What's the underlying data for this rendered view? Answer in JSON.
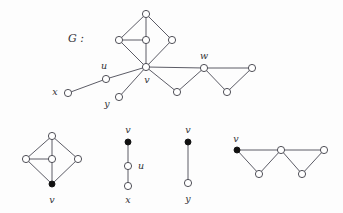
{
  "figure": {
    "caption_label": "G :",
    "background_color": "#fdfdfd",
    "stroke_color": "#4a4a55",
    "node_fill_open": "#ffffff",
    "node_fill_closed": "#111111",
    "label_color": "#333338"
  },
  "chart_data": {
    "type": "diagram",
    "title": "G :",
    "panels": [
      {
        "name": "main-graph",
        "label": "G :",
        "label_x": 76,
        "label_y": 39,
        "nodes": [
          {
            "id": "a",
            "x": 146,
            "y": 14,
            "filled": false,
            "label": ""
          },
          {
            "id": "b",
            "x": 119,
            "y": 40,
            "filled": false,
            "label": ""
          },
          {
            "id": "c",
            "x": 146,
            "y": 40,
            "filled": false,
            "label": ""
          },
          {
            "id": "d",
            "x": 172,
            "y": 40,
            "filled": false,
            "label": ""
          },
          {
            "id": "v",
            "x": 146,
            "y": 67,
            "filled": false,
            "label": "v",
            "label_x": 147,
            "label_y": 80
          },
          {
            "id": "u",
            "x": 106,
            "y": 79,
            "filled": false,
            "label": "u",
            "label_x": 104,
            "label_y": 66
          },
          {
            "id": "x",
            "x": 68,
            "y": 93,
            "filled": false,
            "label": "x",
            "label_x": 55,
            "label_y": 92
          },
          {
            "id": "y",
            "x": 119,
            "y": 97,
            "filled": false,
            "label": "y",
            "label_x": 107,
            "label_y": 104
          },
          {
            "id": "p",
            "x": 177,
            "y": 92,
            "filled": false,
            "label": ""
          },
          {
            "id": "w",
            "x": 204,
            "y": 68,
            "filled": false,
            "label": "w",
            "label_x": 204,
            "label_y": 56
          },
          {
            "id": "q",
            "x": 227,
            "y": 92,
            "filled": false,
            "label": ""
          },
          {
            "id": "r",
            "x": 252,
            "y": 68,
            "filled": false,
            "label": ""
          }
        ],
        "edges": [
          [
            "a",
            "b"
          ],
          [
            "a",
            "c"
          ],
          [
            "a",
            "d"
          ],
          [
            "b",
            "c"
          ],
          [
            "b",
            "v"
          ],
          [
            "c",
            "v"
          ],
          [
            "d",
            "v"
          ],
          [
            "v",
            "u"
          ],
          [
            "u",
            "x"
          ],
          [
            "v",
            "y"
          ],
          [
            "v",
            "p"
          ],
          [
            "p",
            "w"
          ],
          [
            "v",
            "w"
          ],
          [
            "w",
            "q"
          ],
          [
            "q",
            "r"
          ],
          [
            "w",
            "r"
          ]
        ]
      },
      {
        "name": "component-diamond",
        "nodes": [
          {
            "id": "t",
            "x": 52,
            "y": 136,
            "filled": false,
            "label": ""
          },
          {
            "id": "l",
            "x": 26,
            "y": 159,
            "filled": false,
            "label": ""
          },
          {
            "id": "m",
            "x": 52,
            "y": 159,
            "filled": false,
            "label": ""
          },
          {
            "id": "rr",
            "x": 78,
            "y": 159,
            "filled": false,
            "label": ""
          },
          {
            "id": "v",
            "x": 52,
            "y": 184,
            "filled": true,
            "label": "v",
            "label_x": 52,
            "label_y": 200
          }
        ],
        "edges": [
          [
            "t",
            "l"
          ],
          [
            "t",
            "m"
          ],
          [
            "t",
            "rr"
          ],
          [
            "l",
            "m"
          ],
          [
            "l",
            "v"
          ],
          [
            "m",
            "v"
          ],
          [
            "rr",
            "v"
          ]
        ]
      },
      {
        "name": "component-path-vux",
        "nodes": [
          {
            "id": "v",
            "x": 128,
            "y": 142,
            "filled": true,
            "label": "v",
            "label_x": 128,
            "label_y": 130
          },
          {
            "id": "u",
            "x": 128,
            "y": 166,
            "filled": false,
            "label": "u",
            "label_x": 141,
            "label_y": 166
          },
          {
            "id": "x",
            "x": 128,
            "y": 186,
            "filled": false,
            "label": "x",
            "label_x": 128,
            "label_y": 200
          }
        ],
        "edges": [
          [
            "v",
            "u"
          ],
          [
            "u",
            "x"
          ]
        ]
      },
      {
        "name": "component-path-vy",
        "nodes": [
          {
            "id": "v",
            "x": 188,
            "y": 142,
            "filled": true,
            "label": "v",
            "label_x": 188,
            "label_y": 130
          },
          {
            "id": "y",
            "x": 188,
            "y": 183,
            "filled": false,
            "label": "y",
            "label_x": 188,
            "label_y": 199
          }
        ],
        "edges": [
          [
            "v",
            "y"
          ]
        ]
      },
      {
        "name": "component-bowtie",
        "nodes": [
          {
            "id": "v",
            "x": 237,
            "y": 150,
            "filled": true,
            "label": "v",
            "label_x": 236,
            "label_y": 139
          },
          {
            "id": "b1",
            "x": 259,
            "y": 174,
            "filled": false,
            "label": ""
          },
          {
            "id": "w",
            "x": 281,
            "y": 150,
            "filled": false,
            "label": ""
          },
          {
            "id": "b2",
            "x": 302,
            "y": 174,
            "filled": false,
            "label": ""
          },
          {
            "id": "r2",
            "x": 324,
            "y": 150,
            "filled": false,
            "label": ""
          }
        ],
        "edges": [
          [
            "v",
            "b1"
          ],
          [
            "b1",
            "w"
          ],
          [
            "v",
            "w"
          ],
          [
            "w",
            "b2"
          ],
          [
            "b2",
            "r2"
          ],
          [
            "w",
            "r2"
          ]
        ]
      }
    ],
    "node_radius_open": 3.6,
    "node_radius_filled": 3.0
  }
}
